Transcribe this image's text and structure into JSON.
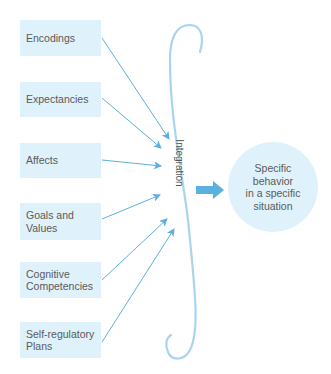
{
  "diagram": {
    "inputs": [
      {
        "label": "Encodings"
      },
      {
        "label": "Expectancies"
      },
      {
        "label": "Affects"
      },
      {
        "label": "Goals and\nValues"
      },
      {
        "label": "Cognitive\nCompetencies"
      },
      {
        "label": "Self-regulatory\nPlans"
      }
    ],
    "integration_label": "Integration",
    "output": {
      "lines": [
        "Specific",
        "behavior",
        "in a specific",
        "situation"
      ]
    },
    "colors": {
      "box_fill": "#dff1fa",
      "arrow": "#5ab0e0",
      "brace": "#a9d4ee",
      "text": "#5a5a5a"
    }
  }
}
